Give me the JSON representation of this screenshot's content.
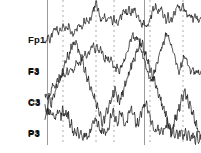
{
  "view": {
    "width": 201,
    "height": 153,
    "background": "#ffffff",
    "trace_color": "#1a1a1a",
    "grid_color": "#9a9a9a",
    "axis_color": "#6e6e6e"
  },
  "labels": {
    "channels": [
      {
        "top": "Fp1",
        "bottom": "F3",
        "x": 28,
        "y": 14
      },
      {
        "top": "F3",
        "bottom": "C3",
        "x": 28,
        "y": 45
      },
      {
        "top": "C3",
        "bottom": "P3",
        "x": 28,
        "y": 76
      },
      {
        "top": "P3",
        "bottom": "O1",
        "x": 28,
        "y": 107
      }
    ]
  },
  "chart_data": {
    "type": "line",
    "title": "",
    "xlabel": "",
    "ylabel": "",
    "grid": true,
    "legend_position": "left",
    "xlim": [
      0,
      201
    ],
    "ylim": [
      0,
      153
    ],
    "plot_area": {
      "x": 45,
      "y": 0,
      "width": 156,
      "height": 145
    },
    "axis_lines_x": [
      47.5,
      144.5
    ],
    "gridlines_dashed_x": [
      63,
      96,
      114,
      150,
      183
    ],
    "series": [
      {
        "name": "Fp1-F3",
        "color": "#1a1a1a",
        "baseline_y": 30,
        "points": [
          [
            45,
            44
          ],
          [
            48,
            36
          ],
          [
            50,
            42
          ],
          [
            53,
            31
          ],
          [
            56,
            28
          ],
          [
            58,
            33
          ],
          [
            61,
            29
          ],
          [
            63,
            27
          ],
          [
            66,
            30
          ],
          [
            69,
            26
          ],
          [
            71,
            32
          ],
          [
            74,
            35
          ],
          [
            76,
            30
          ],
          [
            79,
            24
          ],
          [
            81,
            28
          ],
          [
            84,
            22
          ],
          [
            86,
            20
          ],
          [
            89,
            23
          ],
          [
            91,
            19
          ],
          [
            94,
            8
          ],
          [
            96,
            2
          ],
          [
            98,
            9
          ],
          [
            100,
            17
          ],
          [
            102,
            21
          ],
          [
            104,
            16
          ],
          [
            107,
            20
          ],
          [
            109,
            17
          ],
          [
            112,
            22
          ],
          [
            114,
            19
          ],
          [
            117,
            24
          ],
          [
            119,
            20
          ],
          [
            122,
            15
          ],
          [
            124,
            11
          ],
          [
            127,
            14
          ],
          [
            129,
            10
          ],
          [
            131,
            13
          ],
          [
            134,
            9
          ],
          [
            136,
            14
          ],
          [
            139,
            19
          ],
          [
            141,
            25
          ],
          [
            144,
            21
          ],
          [
            146,
            27
          ],
          [
            148,
            23
          ],
          [
            151,
            16
          ],
          [
            153,
            10
          ],
          [
            156,
            6
          ],
          [
            158,
            12
          ],
          [
            161,
            8
          ],
          [
            163,
            14
          ],
          [
            166,
            20
          ],
          [
            168,
            16
          ],
          [
            170,
            22
          ],
          [
            173,
            18
          ],
          [
            175,
            12
          ],
          [
            178,
            5
          ],
          [
            180,
            10
          ],
          [
            183,
            4
          ],
          [
            185,
            11
          ],
          [
            188,
            17
          ],
          [
            190,
            14
          ],
          [
            193,
            19
          ],
          [
            196,
            16
          ],
          [
            198,
            21
          ],
          [
            201,
            18
          ]
        ]
      },
      {
        "name": "F3-C3",
        "color": "#1a1a1a",
        "baseline_y": 70,
        "points": [
          [
            45,
            120
          ],
          [
            47,
            110
          ],
          [
            49,
            99
          ],
          [
            51,
            90
          ],
          [
            53,
            84
          ],
          [
            55,
            88
          ],
          [
            57,
            80
          ],
          [
            59,
            83
          ],
          [
            61,
            77
          ],
          [
            63,
            72
          ],
          [
            65,
            76
          ],
          [
            67,
            70
          ],
          [
            69,
            74
          ],
          [
            71,
            68
          ],
          [
            73,
            72
          ],
          [
            75,
            66
          ],
          [
            77,
            62
          ],
          [
            79,
            66
          ],
          [
            81,
            60
          ],
          [
            83,
            57
          ],
          [
            85,
            54
          ],
          [
            87,
            58
          ],
          [
            89,
            52
          ],
          [
            91,
            48
          ],
          [
            93,
            44
          ],
          [
            95,
            50
          ],
          [
            97,
            46
          ],
          [
            99,
            52
          ],
          [
            101,
            48
          ],
          [
            103,
            54
          ],
          [
            105,
            60
          ],
          [
            107,
            56
          ],
          [
            109,
            62
          ],
          [
            111,
            58
          ],
          [
            113,
            64
          ],
          [
            115,
            70
          ],
          [
            117,
            66
          ],
          [
            119,
            72
          ],
          [
            121,
            68
          ],
          [
            123,
            63
          ],
          [
            125,
            58
          ],
          [
            127,
            52
          ],
          [
            129,
            46
          ],
          [
            131,
            40
          ],
          [
            133,
            35
          ],
          [
            135,
            41
          ],
          [
            137,
            36
          ],
          [
            139,
            43
          ],
          [
            141,
            50
          ],
          [
            143,
            57
          ],
          [
            145,
            64
          ],
          [
            147,
            70
          ],
          [
            149,
            76
          ],
          [
            151,
            82
          ],
          [
            153,
            76
          ],
          [
            155,
            70
          ],
          [
            157,
            63
          ],
          [
            159,
            56
          ],
          [
            161,
            50
          ],
          [
            163,
            44
          ],
          [
            165,
            38
          ],
          [
            167,
            33
          ],
          [
            169,
            39
          ],
          [
            171,
            45
          ],
          [
            173,
            52
          ],
          [
            175,
            58
          ],
          [
            177,
            65
          ],
          [
            179,
            71
          ],
          [
            181,
            66
          ],
          [
            183,
            60
          ],
          [
            185,
            55
          ],
          [
            187,
            61
          ],
          [
            189,
            67
          ],
          [
            191,
            73
          ],
          [
            193,
            68
          ],
          [
            195,
            74
          ],
          [
            197,
            69
          ],
          [
            199,
            75
          ],
          [
            201,
            71
          ]
        ]
      },
      {
        "name": "C3-P3",
        "color": "#1a1a1a",
        "baseline_y": 100,
        "points": [
          [
            45,
            94
          ],
          [
            47,
            100
          ],
          [
            49,
            96
          ],
          [
            51,
            103
          ],
          [
            53,
            98
          ],
          [
            55,
            92
          ],
          [
            57,
            86
          ],
          [
            59,
            80
          ],
          [
            61,
            75
          ],
          [
            63,
            70
          ],
          [
            65,
            64
          ],
          [
            67,
            59
          ],
          [
            69,
            54
          ],
          [
            71,
            49
          ],
          [
            73,
            45
          ],
          [
            75,
            41
          ],
          [
            77,
            46
          ],
          [
            79,
            52
          ],
          [
            81,
            58
          ],
          [
            83,
            64
          ],
          [
            85,
            70
          ],
          [
            87,
            76
          ],
          [
            89,
            82
          ],
          [
            91,
            88
          ],
          [
            93,
            94
          ],
          [
            95,
            100
          ],
          [
            97,
            106
          ],
          [
            99,
            112
          ],
          [
            101,
            118
          ],
          [
            103,
            124
          ],
          [
            105,
            118
          ],
          [
            107,
            112
          ],
          [
            109,
            106
          ],
          [
            111,
            100
          ],
          [
            113,
            95
          ],
          [
            115,
            90
          ],
          [
            117,
            96
          ],
          [
            119,
            102
          ],
          [
            121,
            97
          ],
          [
            123,
            91
          ],
          [
            125,
            85
          ],
          [
            127,
            79
          ],
          [
            129,
            73
          ],
          [
            131,
            67
          ],
          [
            133,
            61
          ],
          [
            135,
            56
          ],
          [
            137,
            51
          ],
          [
            139,
            46
          ],
          [
            141,
            41
          ],
          [
            143,
            47
          ],
          [
            145,
            53
          ],
          [
            147,
            59
          ],
          [
            149,
            65
          ],
          [
            151,
            71
          ],
          [
            153,
            77
          ],
          [
            155,
            83
          ],
          [
            157,
            89
          ],
          [
            159,
            95
          ],
          [
            161,
            101
          ],
          [
            163,
            107
          ],
          [
            165,
            113
          ],
          [
            167,
            119
          ],
          [
            169,
            125
          ],
          [
            171,
            131
          ],
          [
            173,
            126
          ],
          [
            175,
            120
          ],
          [
            177,
            114
          ],
          [
            179,
            108
          ],
          [
            181,
            102
          ],
          [
            183,
            96
          ],
          [
            185,
            91
          ],
          [
            187,
            97
          ],
          [
            189,
            103
          ],
          [
            191,
            109
          ],
          [
            193,
            115
          ],
          [
            195,
            121
          ],
          [
            197,
            127
          ],
          [
            199,
            133
          ],
          [
            201,
            139
          ]
        ]
      },
      {
        "name": "P3-O1",
        "color": "#1a1a1a",
        "baseline_y": 128,
        "points": [
          [
            45,
            108
          ],
          [
            47,
            114
          ],
          [
            49,
            110
          ],
          [
            51,
            116
          ],
          [
            53,
            112
          ],
          [
            55,
            118
          ],
          [
            57,
            114
          ],
          [
            59,
            109
          ],
          [
            61,
            115
          ],
          [
            63,
            111
          ],
          [
            65,
            117
          ],
          [
            67,
            113
          ],
          [
            69,
            119
          ],
          [
            71,
            124
          ],
          [
            73,
            130
          ],
          [
            75,
            136
          ],
          [
            77,
            131
          ],
          [
            79,
            137
          ],
          [
            81,
            133
          ],
          [
            83,
            139
          ],
          [
            85,
            134
          ],
          [
            87,
            140
          ],
          [
            89,
            135
          ],
          [
            91,
            129
          ],
          [
            93,
            123
          ],
          [
            95,
            117
          ],
          [
            97,
            122
          ],
          [
            99,
            128
          ],
          [
            101,
            134
          ],
          [
            103,
            129
          ],
          [
            105,
            135
          ],
          [
            107,
            130
          ],
          [
            109,
            124
          ],
          [
            111,
            118
          ],
          [
            113,
            112
          ],
          [
            115,
            117
          ],
          [
            117,
            123
          ],
          [
            119,
            118
          ],
          [
            121,
            113
          ],
          [
            123,
            119
          ],
          [
            125,
            125
          ],
          [
            127,
            120
          ],
          [
            129,
            114
          ],
          [
            131,
            108
          ],
          [
            133,
            113
          ],
          [
            135,
            119
          ],
          [
            137,
            125
          ],
          [
            139,
            120
          ],
          [
            141,
            114
          ],
          [
            143,
            108
          ],
          [
            145,
            102
          ],
          [
            147,
            108
          ],
          [
            149,
            114
          ],
          [
            151,
            120
          ],
          [
            153,
            126
          ],
          [
            155,
            132
          ],
          [
            157,
            127
          ],
          [
            159,
            133
          ],
          [
            161,
            128
          ],
          [
            163,
            134
          ],
          [
            165,
            129
          ],
          [
            167,
            123
          ],
          [
            169,
            128
          ],
          [
            171,
            134
          ],
          [
            173,
            129
          ],
          [
            175,
            135
          ],
          [
            177,
            130
          ],
          [
            179,
            136
          ],
          [
            181,
            131
          ],
          [
            183,
            137
          ],
          [
            185,
            132
          ],
          [
            187,
            138
          ],
          [
            189,
            133
          ],
          [
            191,
            139
          ],
          [
            193,
            134
          ],
          [
            195,
            140
          ],
          [
            197,
            135
          ],
          [
            199,
            141
          ],
          [
            201,
            137
          ]
        ]
      }
    ]
  }
}
